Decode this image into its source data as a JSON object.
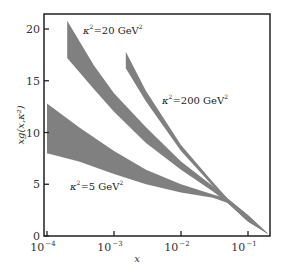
{
  "chart_data": {
    "type": "area",
    "title": "",
    "xlabel": "x",
    "ylabel": "xg(x,κ²)",
    "xscale": "log",
    "xlim": [
      9e-05,
      0.2
    ],
    "ylim": [
      0,
      21
    ],
    "grid": false,
    "x_ticks": [
      {
        "value": 0.0001,
        "base": "10",
        "exp": "−4"
      },
      {
        "value": 0.001,
        "base": "10",
        "exp": "−3"
      },
      {
        "value": 0.01,
        "base": "10",
        "exp": "−2"
      },
      {
        "value": 0.1,
        "base": "10",
        "exp": "−1"
      }
    ],
    "y_ticks": [
      0,
      5,
      10,
      15,
      20
    ],
    "band_color": "#808080",
    "series": [
      {
        "name": "κ²=5 GeV²",
        "label": {
          "pre": "κ",
          "sup1": "2",
          "mid": "=5 GeV",
          "sup2": "2"
        },
        "x": [
          0.0001,
          0.0003,
          0.001,
          0.003,
          0.01,
          0.03,
          0.05,
          0.1,
          0.2
        ],
        "upper": [
          12.8,
          10.5,
          8.2,
          6.4,
          5.0,
          4.0,
          3.6,
          2.0,
          0.2
        ],
        "lower": [
          8.0,
          7.2,
          6.0,
          5.0,
          4.2,
          3.7,
          3.2,
          1.4,
          0.2
        ]
      },
      {
        "name": "κ²=20 GeV²",
        "label": {
          "pre": "κ",
          "sup1": "2",
          "mid": "=20 GeV",
          "sup2": "2"
        },
        "x": [
          0.0002,
          0.0005,
          0.001,
          0.003,
          0.01,
          0.03,
          0.05,
          0.1,
          0.2
        ],
        "upper": [
          20.8,
          16.5,
          13.8,
          10.5,
          7.2,
          4.8,
          3.6,
          2.0,
          0.2
        ],
        "lower": [
          17.2,
          14.2,
          12.0,
          9.0,
          6.4,
          4.3,
          3.2,
          1.4,
          0.2
        ]
      },
      {
        "name": "κ²=200 GeV²",
        "label": {
          "pre": "κ",
          "sup1": "2",
          "mid": "=200 GeV",
          "sup2": "2"
        },
        "x": [
          0.0015,
          0.003,
          0.01,
          0.03,
          0.05,
          0.1,
          0.2
        ],
        "upper": [
          17.8,
          14.0,
          8.8,
          5.2,
          3.6,
          2.0,
          0.2
        ],
        "lower": [
          16.2,
          13.0,
          8.2,
          4.8,
          3.2,
          1.4,
          0.2
        ]
      }
    ]
  }
}
